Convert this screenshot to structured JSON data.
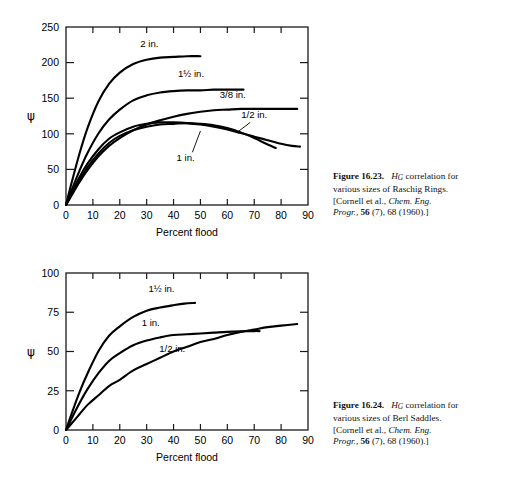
{
  "page": {
    "background": "#ffffff",
    "ink": "#000000"
  },
  "figures": [
    {
      "id": "figure-16-23",
      "caption": {
        "label": "Figure 16.23.",
        "symbol": "H",
        "symbol_sub": "G",
        "line1_rest": "correlation for",
        "line2": "various sizes of Raschig Rings.",
        "line3_prefix": "[Cornell et al.,",
        "line3_italic": "Chem. Eng.",
        "line4_italic": "Progr.,",
        "line4_bold": "56",
        "line4_rest": "(7), 68 (1960).]"
      },
      "chart_data": {
        "type": "line",
        "title": "HG correlation for various sizes of Raschig Rings",
        "xlabel": "Percent flood",
        "ylabel": "ψ",
        "xlim": [
          0,
          90
        ],
        "ylim": [
          0,
          250
        ],
        "xticks": [
          0,
          10,
          20,
          30,
          40,
          50,
          60,
          70,
          80,
          90
        ],
        "yticks": [
          0,
          50,
          100,
          150,
          200,
          250
        ],
        "grid": false,
        "legend_position": "inline-labels",
        "series": [
          {
            "name": "2 in.",
            "label": "2 in.",
            "label_x": 31,
            "label_y": 222,
            "x": [
              0,
              2,
              5,
              8,
              12,
              16,
              20,
              25,
              30,
              35,
              40,
              45,
              50
            ],
            "y": [
              0,
              30,
              72,
              108,
              145,
              170,
              186,
              198,
              204,
              207,
              208,
              209,
              209
            ]
          },
          {
            "name": "1 1/2 in.",
            "label": "1½ in.",
            "label_x": 46.5,
            "label_y": 180,
            "x": [
              0,
              2,
              5,
              8,
              12,
              16,
              20,
              25,
              30,
              35,
              40,
              45,
              50,
              55,
              60,
              66
            ],
            "y": [
              0,
              20,
              48,
              73,
              100,
              120,
              134,
              147,
              154,
              158,
              160,
              161,
              161,
              162,
              162,
              162
            ]
          },
          {
            "name": "3/8 in.",
            "label": "3/8 in.",
            "label_x": 62,
            "label_y": 150,
            "x": [
              0,
              2,
              5,
              8,
              12,
              16,
              20,
              25,
              30,
              35,
              40,
              45,
              50,
              55,
              60,
              65,
              70,
              75,
              80,
              86
            ],
            "y": [
              0,
              13,
              32,
              49,
              68,
              83,
              94,
              105,
              113,
              119,
              124,
              128,
              131,
              133,
              134,
              135,
              135,
              135,
              135,
              135
            ]
          },
          {
            "name": "1/2 in.",
            "label": "1/2 in.",
            "label_x": 70,
            "label_y": 122,
            "x": [
              0,
              2,
              5,
              8,
              12,
              16,
              20,
              25,
              30,
              35,
              40,
              45,
              50,
              55,
              60,
              65,
              70,
              75,
              80,
              84,
              87
            ],
            "y": [
              0,
              16,
              39,
              58,
              78,
              93,
              102,
              110,
              114,
              116,
              116,
              115,
              113,
              110,
              106,
              101,
              96,
              91,
              86,
              83,
              82
            ],
            "leader": {
              "x1": 68.5,
              "y1": 116,
              "x2": 64,
              "y2": 103
            }
          },
          {
            "name": "1 in.",
            "label": "1 in.",
            "label_x": 44.5,
            "label_y": 62,
            "x": [
              0,
              2,
              5,
              8,
              12,
              16,
              20,
              25,
              30,
              35,
              40,
              45,
              50,
              55,
              60,
              65,
              70,
              75,
              78
            ],
            "y": [
              0,
              14,
              35,
              53,
              72,
              87,
              97,
              105,
              110,
              113,
              114,
              115,
              114,
              112,
              108,
              102,
              94,
              85,
              80
            ],
            "leader": {
              "x1": 47,
              "y1": 74,
              "x2": 50,
              "y2": 104
            }
          }
        ]
      }
    },
    {
      "id": "figure-16-24",
      "caption": {
        "label": "Figure 16.24.",
        "symbol": "H",
        "symbol_sub": "G",
        "line1_rest": "correlation for",
        "line2": "various sizes of Berl Saddles.",
        "line3_prefix": "[Cornell et al.,",
        "line3_italic": "Chem. Eng.",
        "line4_italic": "Progr.,",
        "line4_bold": "56",
        "line4_rest": "(7), 68 (1960).]"
      },
      "chart_data": {
        "type": "line",
        "title": "HG correlation for various sizes of Berl Saddles",
        "xlabel": "Percent flood",
        "ylabel": "ψ",
        "xlim": [
          0,
          90
        ],
        "ylim": [
          0,
          100
        ],
        "xticks": [
          0,
          10,
          20,
          30,
          40,
          50,
          60,
          70,
          80,
          90
        ],
        "yticks": [
          0,
          25,
          50,
          75,
          100
        ],
        "grid": false,
        "legend_position": "inline-labels",
        "series": [
          {
            "name": "1 1/2 in.",
            "label": "1½ in.",
            "label_x": 35.5,
            "label_y": 88,
            "x": [
              0,
              2,
              5,
              8,
              12,
              16,
              20,
              25,
              30,
              35,
              40,
              44,
              48
            ],
            "y": [
              0,
              10,
              24,
              36,
              50,
              60,
              66,
              72,
              76,
              78,
              79.5,
              80.5,
              81
            ]
          },
          {
            "name": "1 in.",
            "label": "1 in.",
            "label_x": 31.5,
            "label_y": 66,
            "x": [
              0,
              2,
              5,
              8,
              12,
              16,
              20,
              25,
              30,
              35,
              40,
              45,
              50,
              55,
              60,
              65,
              70,
              72
            ],
            "y": [
              0,
              7,
              17,
              26,
              36,
              44,
              49,
              54,
              57,
              59,
              60.5,
              61,
              61.5,
              62,
              62.5,
              62.8,
              63,
              63
            ]
          },
          {
            "name": "1/2 in.",
            "label": "1/2 in.",
            "label_x": 39.5,
            "label_y": 50,
            "x": [
              0,
              2,
              5,
              8,
              12,
              16,
              20,
              25,
              30,
              35,
              40,
              45,
              50,
              55,
              60,
              65,
              70,
              75,
              80,
              86
            ],
            "y": [
              0,
              4,
              10,
              16,
              22,
              28,
              32,
              38,
              42,
              46,
              50,
              53,
              56,
              58,
              60.5,
              62.5,
              64,
              65.5,
              66.5,
              67.5
            ]
          }
        ]
      }
    }
  ]
}
